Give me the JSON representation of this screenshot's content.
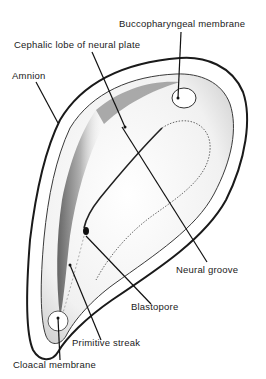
{
  "diagram": {
    "labels": {
      "buccopharyngeal": "Buccopharyngeal membrane",
      "cephalic_lobe": "Cephalic lobe of neural plate",
      "amnion": "Amnion",
      "neural_groove": "Neural groove",
      "blastopore": "Blastopore",
      "primitive_streak": "Primitive streak",
      "cloacal": "Cloacal membrane"
    },
    "colors": {
      "ink": "#1a1a1a",
      "stipple_dark": "#444444",
      "stipple_light": "#d8d8d8",
      "background": "#ffffff"
    }
  }
}
